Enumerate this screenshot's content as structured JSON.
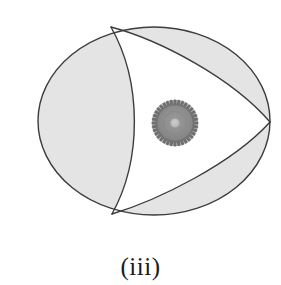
{
  "figure": {
    "caption": "(iii)",
    "title": "",
    "colors": {
      "background": "#ffffff",
      "shaded_region_fill": "#e4e4e4",
      "outline_stroke": "#3c3c3c",
      "inner_region_fill": "#ffffff",
      "gear_body": "#8a8a8a",
      "gear_teeth": "#6f6f6f",
      "gear_hub": "#c0c0c0",
      "gear_outline": "#5a5a5a"
    },
    "outer_oval": {
      "shape": "ellipse",
      "center_x": 154,
      "center_y": 121,
      "radius_x": 116,
      "radius_y": 95
    },
    "vertices": [
      {
        "name": "top-vertex",
        "x": 111,
        "y": 27
      },
      {
        "name": "right-vertex",
        "x": 270,
        "y": 122
      },
      {
        "name": "bottom-vertex",
        "x": 112,
        "y": 214
      }
    ],
    "inner_curved_triangle": {
      "description": "white curved triangle bounded by three arcs joining the three vertices",
      "arc_count": 3
    },
    "shaded_regions": [
      {
        "name": "left-crescent",
        "fill": "#e4e4e4"
      },
      {
        "name": "upper-right-crescent",
        "fill": "#e4e4e4"
      },
      {
        "name": "lower-right-crescent",
        "fill": "#e4e4e4"
      }
    ],
    "gear": {
      "center_x": 175,
      "center_y": 123,
      "outer_radius": 23,
      "root_radius": 19.5,
      "body_radius": 18,
      "hub_radius": 4.5,
      "tooth_count": 36
    }
  }
}
